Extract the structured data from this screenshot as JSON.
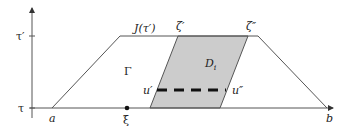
{
  "diagram": {
    "axes": {
      "y_tick_upper": "τ′",
      "y_tick_lower": "τ"
    },
    "labels": {
      "a": "a",
      "b": "b",
      "xi": "ξ",
      "J": "J(τ′)",
      "Gamma": "Γ",
      "zeta_prime": "ζ′",
      "zeta_double": "ζ″",
      "D": "D",
      "D_sub": "i",
      "u_prime": "u′",
      "u_double": "u″"
    },
    "colors": {
      "shaded_region": "#cccccc",
      "line": "#555555",
      "dashed": "#111111"
    }
  }
}
